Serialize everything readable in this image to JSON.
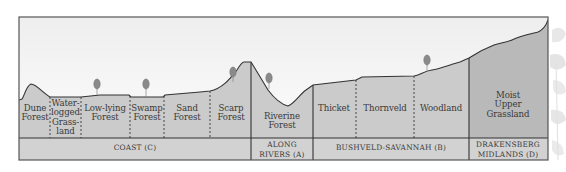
{
  "diagram": {
    "colors": {
      "sky_top": "#f0f0f0",
      "sky_bottom": "#fbfbfb",
      "ground": "#cbcbcb",
      "ground_drakensberg": "#b9b9b9",
      "band": "#d2d2d2",
      "line": "#3c3c3c",
      "tree": "#8a8a8a",
      "text": "#3a3a3a"
    },
    "vegetation_zones": [
      {
        "id": "dune-forest",
        "label": "Dune\nForest"
      },
      {
        "id": "waterlogged-grassland",
        "label": "Water-\nlogged\nGrass-\nland"
      },
      {
        "id": "low-lying-forest",
        "label": "Low-lying\nForest"
      },
      {
        "id": "swamp-forest",
        "label": "Swamp\nForest"
      },
      {
        "id": "sand-forest",
        "label": "Sand\nForest"
      },
      {
        "id": "scarp-forest",
        "label": "Scarp\nForest"
      },
      {
        "id": "riverine-forest",
        "label": "Riverine\nForest"
      },
      {
        "id": "thicket",
        "label": "Thicket"
      },
      {
        "id": "thornveld",
        "label": "Thornveld"
      },
      {
        "id": "woodland",
        "label": "Woodland"
      },
      {
        "id": "moist-upper-grassland",
        "label": "Moist\nUpper\nGrassland"
      }
    ],
    "regions": [
      {
        "id": "coast",
        "label": "COAST (C)"
      },
      {
        "id": "along-rivers",
        "label": "ALONG\nRIVERS (A)"
      },
      {
        "id": "bushveld-savannah",
        "label": "BUSHVELD-SAVANNAH (B)"
      },
      {
        "id": "drakensberg-midlands",
        "label": "DRAKENSBERG\nMIDLANDS (D)"
      }
    ]
  }
}
